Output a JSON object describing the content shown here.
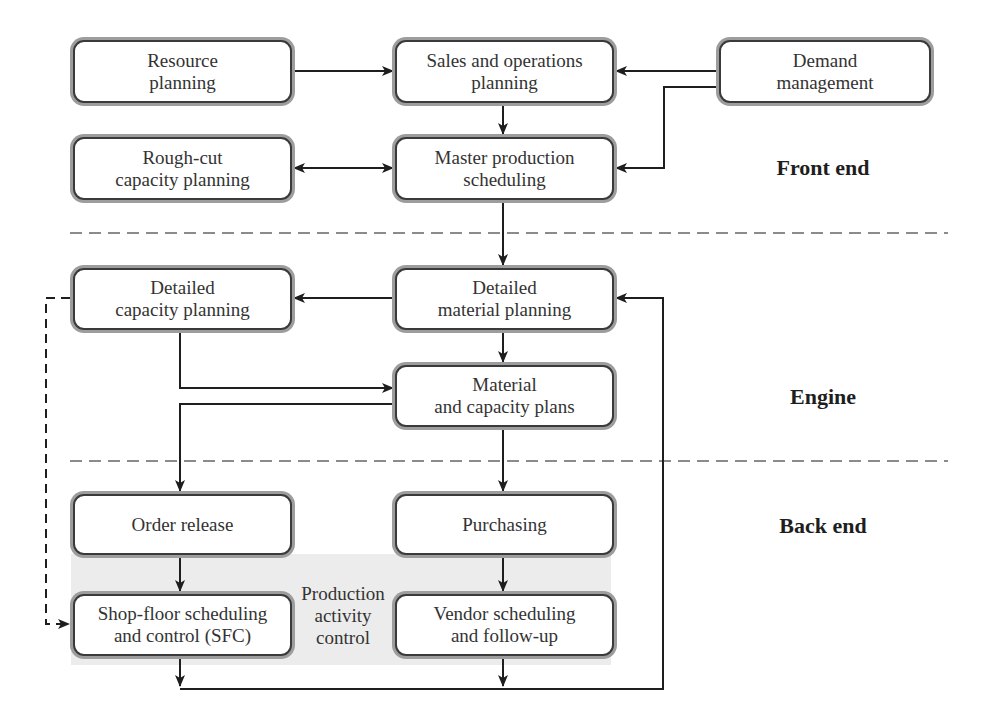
{
  "diagram": {
    "colors": {
      "box_border": "#3a3a3a",
      "box_halo": "#9d9d9d",
      "line": "#1e1e1e",
      "dashed": "#666666",
      "shade": "#ececec"
    }
  },
  "sections": {
    "front_end": "Front end",
    "engine": "Engine",
    "back_end": "Back end"
  },
  "boxes": {
    "resource_planning": {
      "line1": "Resource",
      "line2": "planning"
    },
    "sop": {
      "line1": "Sales and operations",
      "line2": "planning"
    },
    "demand_management": {
      "line1": "Demand",
      "line2": "management"
    },
    "rccp": {
      "line1": "Rough-cut",
      "line2": "capacity planning"
    },
    "mps": {
      "line1": "Master production",
      "line2": "scheduling"
    },
    "detailed_capacity": {
      "line1": "Detailed",
      "line2": "capacity planning"
    },
    "detailed_material": {
      "line1": "Detailed",
      "line2": "material planning"
    },
    "material_capacity_plans": {
      "line1": "Material",
      "line2": "and capacity plans"
    },
    "order_release": {
      "line1": "Order release"
    },
    "purchasing": {
      "line1": "Purchasing"
    },
    "sfc": {
      "line1": "Shop-floor scheduling",
      "line2": "and control (SFC)"
    },
    "vendor_scheduling": {
      "line1": "Vendor scheduling",
      "line2": "and follow-up"
    }
  },
  "pac_label": {
    "line1": "Production",
    "line2": "activity",
    "line3": "control"
  },
  "edges": [
    {
      "from": "Resource planning",
      "to": "Sales and operations planning"
    },
    {
      "from": "Demand management",
      "to": "Sales and operations planning"
    },
    {
      "from": "Demand management",
      "to": "Master production scheduling"
    },
    {
      "from": "Sales and operations planning",
      "to": "Master production scheduling"
    },
    {
      "from": "Rough-cut capacity planning",
      "to": "Master production scheduling",
      "bidirectional": true
    },
    {
      "from": "Master production scheduling",
      "to": "Detailed material planning"
    },
    {
      "from": "Detailed material planning",
      "to": "Detailed capacity planning"
    },
    {
      "from": "Detailed material planning",
      "to": "Material and capacity plans"
    },
    {
      "from": "Detailed capacity planning",
      "to": "Material and capacity plans"
    },
    {
      "from": "Material and capacity plans",
      "to": "Order release"
    },
    {
      "from": "Material and capacity plans",
      "to": "Purchasing"
    },
    {
      "from": "Order release",
      "to": "Shop-floor scheduling and control (SFC)"
    },
    {
      "from": "Purchasing",
      "to": "Vendor scheduling and follow-up"
    },
    {
      "from": "Detailed capacity planning",
      "to": "Shop-floor scheduling and control (SFC)",
      "dashed": true
    },
    {
      "from": "Shop-floor scheduling and control (SFC)",
      "to": "Detailed material planning",
      "feedback": true
    },
    {
      "from": "Vendor scheduling and follow-up",
      "to": "Detailed material planning",
      "feedback": true
    }
  ]
}
